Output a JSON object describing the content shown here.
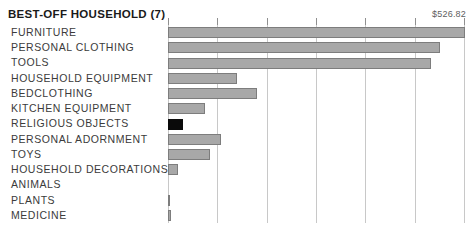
{
  "header": {
    "title": "BEST-OFF HOUSEHOLD (7)",
    "max_value_label": "$526.82"
  },
  "chart_data": {
    "type": "bar",
    "orientation": "horizontal",
    "title": "BEST-OFF HOUSEHOLD (7)",
    "xlabel": "",
    "ylabel": "",
    "value_prefix": "$",
    "xlim": [
      0,
      526.82
    ],
    "grid": true,
    "gridline_count": 7,
    "tick_values": [
      0,
      87.8,
      175.6,
      263.4,
      351.2,
      439.0,
      526.82
    ],
    "legend": "none",
    "highlight_category": "RELIGIOUS OBJECTS",
    "highlight_color": "#0a0a0a",
    "bar_color": "#a8a8a8",
    "bar_border_color": "#7d7d7d",
    "categories": [
      "FURNITURE",
      "PERSONAL CLOTHING",
      "TOOLS",
      "HOUSEHOLD EQUIPMENT",
      "BEDCLOTHING",
      "KITCHEN EQUIPMENT",
      "RELIGIOUS OBJECTS",
      "PERSONAL ADORNMENT",
      "TOYS",
      "HOUSEHOLD DECORATIONS",
      "ANIMALS",
      "PLANTS",
      "MEDICINE"
    ],
    "values": [
      526.82,
      482.0,
      466.0,
      122.0,
      158.0,
      66.0,
      27.0,
      94.0,
      74.0,
      18.0,
      0.0,
      4.0,
      4.5
    ]
  }
}
